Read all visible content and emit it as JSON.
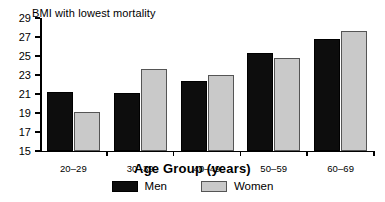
{
  "chart_data": {
    "type": "bar",
    "title": "BMI with lowest mortality",
    "xlabel": "Age Group (years)",
    "ylabel": "",
    "categories": [
      "20–29",
      "30–39",
      "40–49",
      "50–59",
      "60–69"
    ],
    "series": [
      {
        "name": "Men",
        "color": "#0d0d0d",
        "values": [
          21.2,
          21.1,
          22.4,
          25.3,
          26.8
        ]
      },
      {
        "name": "Women",
        "color": "#c9c9c9",
        "values": [
          19.1,
          23.6,
          23.0,
          24.8,
          27.6
        ]
      }
    ],
    "ylim": [
      15,
      29
    ],
    "ytick_step": 2,
    "yticks": [
      15,
      17,
      19,
      21,
      23,
      25,
      27,
      29
    ],
    "ytick_labels": [
      "15",
      "17",
      "19",
      "21",
      "23",
      "25",
      "27",
      "29"
    ],
    "grid": false,
    "legend_position": "bottom-center"
  }
}
